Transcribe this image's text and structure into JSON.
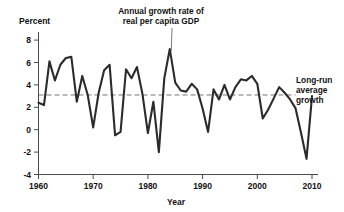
{
  "chart_data": {
    "type": "line",
    "title": "",
    "xlabel": "Year",
    "ylabel": "Percent",
    "xlim": [
      1960,
      2011
    ],
    "ylim": [
      -4,
      8
    ],
    "grid": false,
    "xticks": [
      1960,
      1970,
      1980,
      1990,
      2000,
      2010
    ],
    "xtick_labels": [
      "1960",
      "1970",
      "1980",
      "1990",
      "2000",
      "2010"
    ],
    "yticks": [
      -4,
      -2,
      0,
      2,
      4,
      6,
      8
    ],
    "ytick_labels": [
      "-4",
      "-2",
      "0",
      "2",
      "4",
      "6",
      "8"
    ],
    "series": [
      {
        "name": "Annual growth rate of real per capita GDP",
        "color": "#2b2b2b",
        "x": [
          1960,
          1961,
          1962,
          1963,
          1964,
          1965,
          1966,
          1967,
          1968,
          1969,
          1970,
          1971,
          1972,
          1973,
          1974,
          1975,
          1976,
          1977,
          1978,
          1979,
          1980,
          1981,
          1982,
          1983,
          1984,
          1985,
          1986,
          1987,
          1988,
          1989,
          1990,
          1991,
          1992,
          1993,
          1994,
          1995,
          1996,
          1997,
          1998,
          1999,
          2000,
          2001,
          2002,
          2003,
          2004,
          2005,
          2006,
          2007,
          2008,
          2009,
          2010
        ],
        "y": [
          2.4,
          2.2,
          6.1,
          4.4,
          5.8,
          6.4,
          6.5,
          2.5,
          4.8,
          3.1,
          0.2,
          3.3,
          5.3,
          5.8,
          -0.5,
          -0.2,
          5.4,
          4.6,
          5.6,
          3.2,
          -0.3,
          2.5,
          -2.0,
          4.6,
          7.2,
          4.2,
          3.5,
          3.4,
          4.1,
          3.6,
          1.9,
          -0.2,
          3.6,
          2.7,
          4.0,
          2.7,
          3.8,
          4.5,
          4.4,
          4.8,
          4.1,
          1.0,
          1.8,
          2.8,
          3.8,
          3.3,
          2.7,
          1.9,
          -0.3,
          -2.6,
          3.0
        ]
      }
    ],
    "reference_line": {
      "name": "Long-run average growth",
      "value": 3.1,
      "style": "dashed",
      "color": "#666666",
      "x_start": 1960,
      "x_end": 2007
    },
    "annotations": [
      {
        "name": "series-annotation",
        "lines": [
          "Annual growth rate of",
          "real per capita GDP"
        ],
        "points_to_x": 1984,
        "points_to_y": 7.2
      },
      {
        "name": "reference-line-annotation",
        "lines": [
          "Long-run",
          "average",
          "growth"
        ]
      }
    ]
  }
}
